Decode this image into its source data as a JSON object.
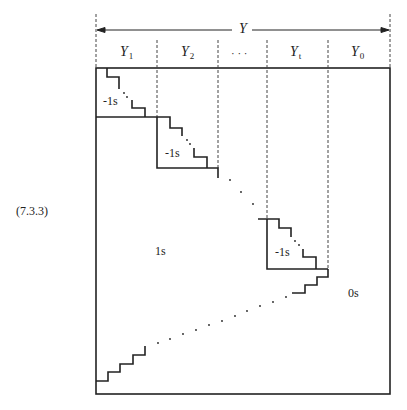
{
  "equation_number": "(7.3.3)",
  "dimension": {
    "total_label": "Y"
  },
  "columns": [
    {
      "base": "Y",
      "sub": "1"
    },
    {
      "base": "Y",
      "sub": "2"
    },
    {
      "base": "· · ·",
      "sub": ""
    },
    {
      "base": "Y",
      "sub": "t"
    },
    {
      "base": "Y",
      "sub": "0"
    }
  ],
  "blocks": [
    {
      "label": "-1s"
    },
    {
      "label": "-1s"
    },
    {
      "label": "-1s"
    }
  ],
  "regions": {
    "lower_left": "1s",
    "right": "0s"
  },
  "colors": {
    "line": "#222222",
    "dashed": "#444444"
  }
}
